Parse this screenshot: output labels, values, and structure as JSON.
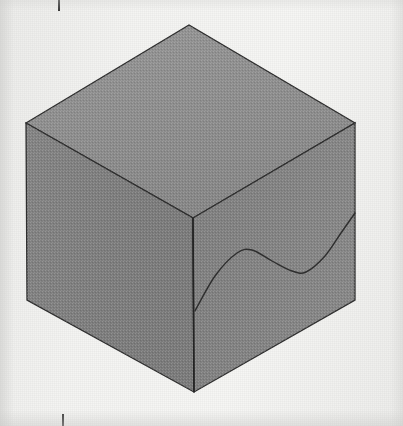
{
  "figure": {
    "background_color": "#f2f2f0",
    "ink_color": "#2b2b2b",
    "faces": {
      "top": {
        "name": "top-face",
        "fill": "#8d8d8d"
      },
      "left": {
        "name": "left-front-face",
        "fill": "#7e7e7e"
      },
      "right": {
        "name": "right-front-face",
        "fill": "#808080"
      }
    },
    "vertices": {
      "top_back": [
        189,
        25
      ],
      "top_left": [
        26,
        123
      ],
      "top_right": [
        355,
        123
      ],
      "top_front": [
        193,
        218
      ],
      "bottom_left": [
        27,
        300
      ],
      "bottom_front": [
        194,
        392
      ],
      "bottom_right": [
        355,
        300
      ]
    },
    "curve": {
      "name": "wave-curve",
      "points": [
        [
          195,
          311
        ],
        [
          215,
          276
        ],
        [
          237,
          253
        ],
        [
          252,
          250
        ],
        [
          272,
          261
        ],
        [
          292,
          271
        ],
        [
          306,
          272
        ],
        [
          325,
          256
        ],
        [
          341,
          233
        ],
        [
          355,
          213
        ]
      ],
      "stroke": "#2e2e2e",
      "stroke_width": 1.4
    },
    "registration_marks": [
      {
        "name": "tick-top",
        "x": 58,
        "y": 0,
        "length": 11
      },
      {
        "name": "tick-bottom",
        "x": 62,
        "y": 414,
        "length": 12
      }
    ]
  }
}
